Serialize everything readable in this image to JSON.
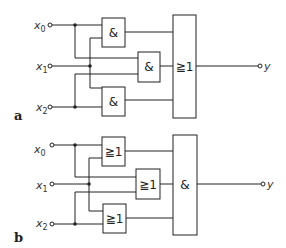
{
  "circuits": [
    {
      "label": "a",
      "inputs": [
        {
          "name": "x",
          "sub": "0"
        },
        {
          "name": "x",
          "sub": "1"
        },
        {
          "name": "x",
          "sub": "2"
        }
      ],
      "first_stage_gates": [
        "&",
        "&",
        "&"
      ],
      "output_gate": "≧1",
      "output": "y"
    },
    {
      "label": "b",
      "inputs": [
        {
          "name": "x",
          "sub": "0"
        },
        {
          "name": "x",
          "sub": "1"
        },
        {
          "name": "x",
          "sub": "2"
        }
      ],
      "first_stage_gates": [
        "≧1",
        "≧1",
        "≧1"
      ],
      "output_gate": "&",
      "output": "y"
    }
  ]
}
